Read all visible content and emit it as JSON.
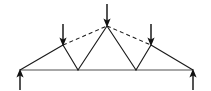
{
  "figure": {
    "kind": "truss-free-body-diagram",
    "width": 211,
    "height": 91,
    "background_color": "#ffffff"
  },
  "colors": {
    "member": "#1a1a1a",
    "bottom_chord": "#8a8a8a",
    "arrow": "#121212",
    "dashed": "#1a1a1a"
  },
  "nodes": [
    {
      "id": "left-support",
      "label": "A",
      "x": 20,
      "y": 70
    },
    {
      "id": "left-panel",
      "label": "B",
      "x": 63,
      "y": 45
    },
    {
      "id": "bottom-left",
      "label": "C",
      "x": 78,
      "y": 70
    },
    {
      "id": "apex",
      "label": "D",
      "x": 107,
      "y": 26
    },
    {
      "id": "bottom-right",
      "label": "E",
      "x": 136,
      "y": 70
    },
    {
      "id": "right-panel",
      "label": "F",
      "x": 151,
      "y": 45
    },
    {
      "id": "right-support",
      "label": "G",
      "x": 193,
      "y": 70
    }
  ],
  "members": {
    "bottom_chord": {
      "name": "bottom-chord",
      "x1": 20,
      "y1": 70,
      "x2": 193,
      "y2": 70,
      "style": "solid",
      "color": "#8a8a8a"
    },
    "solid": [
      {
        "name": "top-chord-left-lower",
        "x1": 20,
        "y1": 70,
        "x2": 63,
        "y2": 45
      },
      {
        "name": "web-left-down",
        "x1": 63,
        "y1": 45,
        "x2": 78,
        "y2": 70
      },
      {
        "name": "web-left-up",
        "x1": 78,
        "y1": 70,
        "x2": 107,
        "y2": 26
      },
      {
        "name": "web-right-down",
        "x1": 107,
        "y1": 26,
        "x2": 136,
        "y2": 70
      },
      {
        "name": "web-right-up",
        "x1": 136,
        "y1": 70,
        "x2": 151,
        "y2": 45
      },
      {
        "name": "top-chord-right-lower",
        "x1": 151,
        "y1": 45,
        "x2": 193,
        "y2": 70
      }
    ],
    "dashed": [
      {
        "name": "top-chord-left-dashed",
        "x1": 63,
        "y1": 45,
        "x2": 107,
        "y2": 26
      },
      {
        "name": "top-chord-right-dashed",
        "x1": 107,
        "y1": 26,
        "x2": 151,
        "y2": 45
      }
    ]
  },
  "loads": [
    {
      "name": "load-arrow-left",
      "direction": "down",
      "x": 63,
      "tail_y": 24,
      "tip_y": 45
    },
    {
      "name": "load-arrow-center",
      "direction": "down",
      "x": 107,
      "tail_y": 4,
      "tip_y": 26
    },
    {
      "name": "load-arrow-right",
      "direction": "down",
      "x": 151,
      "tail_y": 24,
      "tip_y": 45
    }
  ],
  "reactions": [
    {
      "name": "reaction-arrow-left",
      "direction": "up",
      "x": 20,
      "tail_y": 90,
      "tip_y": 70
    },
    {
      "name": "reaction-arrow-right",
      "direction": "up",
      "x": 193,
      "tail_y": 90,
      "tip_y": 70
    }
  ]
}
